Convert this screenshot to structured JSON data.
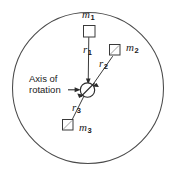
{
  "figure": {
    "type": "physics-schematic-diagram",
    "width": 173,
    "height": 174,
    "background_color": "#ffffff",
    "line_color": "#3a3a3a",
    "text_color": "#1a1a1a"
  },
  "disk": {
    "name": "rotating-disk",
    "shape": "circle",
    "center": {
      "x": 88,
      "y": 88
    },
    "radius": 76,
    "stroke": "#4a4a4a"
  },
  "hub": {
    "name": "axis-hub",
    "shape": "circle-with-diagonal-slash",
    "center": {
      "x": 87.5,
      "y": 90
    },
    "radius": 7.5
  },
  "axis_label": {
    "line1": "Axis of",
    "line2": "rotation",
    "arrow": "right-arrow"
  },
  "masses": [
    {
      "id": "m1",
      "label": "m",
      "subscript": "1",
      "radius_label": "r",
      "radius_subscript": "1",
      "square": {
        "x": 83,
        "y": 25,
        "size": 12
      },
      "label_pos": {
        "x": 82,
        "y": 10
      },
      "radius_label_pos": {
        "x": 83,
        "y": 45
      }
    },
    {
      "id": "m2",
      "label": "m",
      "subscript": "2",
      "radius_label": "r",
      "radius_subscript": "2",
      "square": {
        "x": 109,
        "y": 44,
        "size": 11
      },
      "label_pos": {
        "x": 126,
        "y": 43
      },
      "radius_label_pos": {
        "x": 99,
        "y": 60
      }
    },
    {
      "id": "m3",
      "label": "m",
      "subscript": "3",
      "radius_label": "r",
      "radius_subscript": "3",
      "square": {
        "x": 62,
        "y": 119,
        "size": 11
      },
      "label_pos": {
        "x": 79,
        "y": 123
      },
      "radius_label_pos": {
        "x": 72,
        "y": 103
      }
    }
  ]
}
